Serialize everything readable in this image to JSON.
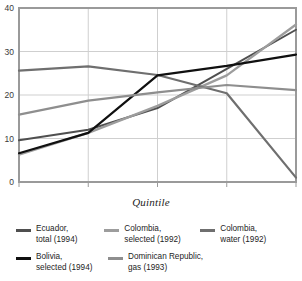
{
  "chart_data": {
    "type": "line",
    "title": "",
    "xlabel": "Quintile",
    "ylabel": "",
    "categories": [
      "1",
      "2",
      "3",
      "4",
      "5"
    ],
    "x": [
      1,
      2,
      3,
      4,
      5
    ],
    "xlim": [
      1,
      5
    ],
    "ylim": [
      0,
      40
    ],
    "yticks": [
      0,
      10,
      20,
      30,
      40
    ],
    "ytick_labels": [
      "0",
      "10",
      "20",
      "30",
      "40"
    ],
    "xticks": [
      1,
      2,
      3,
      4,
      5
    ],
    "xtick_labels": [
      "1",
      "2",
      "3",
      "4",
      "5"
    ],
    "grid": "horizontal-and-vertical",
    "legend_position": "below",
    "series": [
      {
        "name": "Ecuador, total (1994)",
        "label_line1": "Ecuador,",
        "label_line2": "total (1994)",
        "color": "#4f4f4f",
        "width": 2.0,
        "values": [
          9.6,
          12.0,
          17.0,
          26.0,
          35.0
        ]
      },
      {
        "name": "Colombia, selected (1992)",
        "label_line1": "Colombia,",
        "label_line2": "selected (1992)",
        "color": "#9d9d9d",
        "width": 2.3,
        "values": [
          6.3,
          11.3,
          17.5,
          24.5,
          36.2
        ]
      },
      {
        "name": "Colombia, water (1992)",
        "label_line1": "Colombia,",
        "label_line2": "water (1992)",
        "color": "#6f6f6f",
        "width": 2.2,
        "values": [
          25.6,
          26.6,
          24.6,
          20.4,
          1.0
        ]
      },
      {
        "name": "Bolivia, selected (1994)",
        "label_line1": "Bolivia,",
        "label_line2": "selected (1994)",
        "color": "#101010",
        "width": 2.2,
        "values": [
          6.6,
          11.3,
          24.5,
          26.7,
          29.3
        ]
      },
      {
        "name": "Dominican Republic, gas (1993)",
        "label_line1": "Dominican Republic,",
        "label_line2": "gas (1993)",
        "color": "#8e8e8e",
        "width": 2.2,
        "values": [
          15.5,
          18.7,
          20.6,
          22.3,
          21.1
        ]
      }
    ],
    "axis_color": "#9a9a9a",
    "grid_color": "#cfcfcf",
    "background": "#ffffff"
  }
}
